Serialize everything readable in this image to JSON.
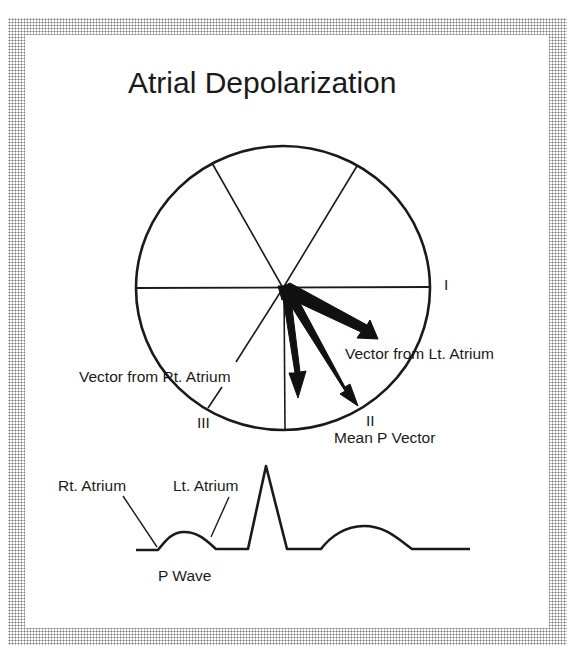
{
  "title": "Atrial Depolarization",
  "hexaxial": {
    "lead_labels": {
      "I": "I",
      "II": "II",
      "III": "III"
    },
    "vectors": {
      "left_atrium": "Vector from Lt. Atrium",
      "right_atrium": "Vector from Rt. Atrium",
      "mean_p": "Mean P Vector"
    }
  },
  "ecg": {
    "labels": {
      "right_atrium": "Rt. Atrium",
      "left_atrium": "Lt. Atrium",
      "p_wave": "P Wave"
    }
  },
  "colors": {
    "ink": "#1a1a1a",
    "background": "#ffffff",
    "frame_dots": "#7a7a7a"
  }
}
